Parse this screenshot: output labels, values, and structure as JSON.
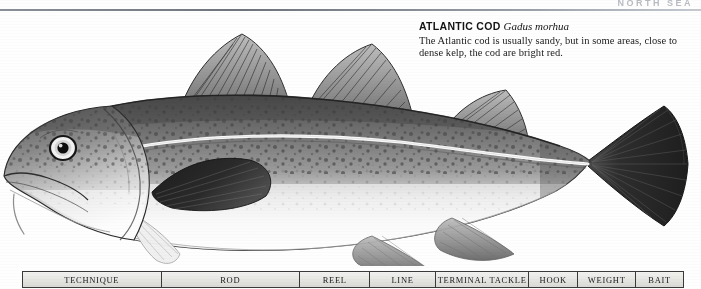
{
  "page": {
    "running_head": "NORTH SEA",
    "background_color": "#ffffff"
  },
  "caption": {
    "species_common": "ATLANTIC COD",
    "species_latin": "Gadus morhua",
    "description": "The Atlantic cod is usually sandy, but in some areas, close to dense kelp, the cod are bright red."
  },
  "illustration": {
    "subject": "atlantic-cod-fish",
    "description_alt": "Side view engraving of an Atlantic cod facing left, with three dorsal fins, two anal fins, pale speckled belly, white lateral line and dark fan-shaped tail",
    "ink_color": "#2b2b2b",
    "body_tone": "#8d8d8d",
    "belly_tone": "#f6f6f6"
  },
  "spec_table": {
    "columns": [
      {
        "label": "TECHNIQUE",
        "width": 148
      },
      {
        "label": "ROD",
        "width": 148
      },
      {
        "label": "REEL",
        "width": 75
      },
      {
        "label": "LINE",
        "width": 70
      },
      {
        "label": "TERMINAL TACKLE",
        "width": 100
      },
      {
        "label": "HOOK",
        "width": 52
      },
      {
        "label": "WEIGHT",
        "width": 62
      },
      {
        "label": "BAIT",
        "width": 50
      }
    ],
    "border_color": "#3a3a3a",
    "fill_color": "#e9e9e7"
  }
}
